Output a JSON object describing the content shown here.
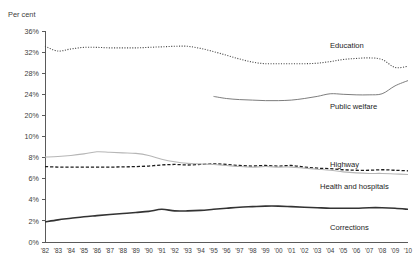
{
  "chart_data": {
    "type": "line",
    "title": "",
    "ylabel": "Per cent",
    "xlabel": "",
    "grid": false,
    "legend_position": "inline-right",
    "broken_axis": true,
    "axis_note": "Y axis is broken: upper band 20%-36%, lower band 0%-10%",
    "y_upper_ticks": [
      "36%",
      "32%",
      "28%",
      "24%",
      "20%"
    ],
    "y_lower_ticks": [
      "10%",
      "8%",
      "6%",
      "4%",
      "2%",
      "0%"
    ],
    "y_upper_values": [
      36,
      32,
      28,
      24,
      20
    ],
    "y_lower_values": [
      10,
      8,
      6,
      4,
      2,
      0
    ],
    "ylim_upper": [
      20,
      36
    ],
    "ylim_lower": [
      0,
      10
    ],
    "categories": [
      "'82",
      "'83",
      "'84",
      "'85",
      "'86",
      "'87",
      "'88",
      "'89",
      "'90",
      "'91",
      "'92",
      "'93",
      "'94",
      "'95",
      "'96",
      "'97",
      "'98",
      "'99",
      "'00",
      "'01",
      "'02",
      "'03",
      "'04",
      "'05",
      "'06",
      "'07",
      "'08",
      "'09",
      "'10"
    ],
    "x": [
      1982,
      1983,
      1984,
      1985,
      1986,
      1987,
      1988,
      1989,
      1990,
      1991,
      1992,
      1993,
      1994,
      1995,
      1996,
      1997,
      1998,
      1999,
      2000,
      2001,
      2002,
      2003,
      2004,
      2005,
      2006,
      2007,
      2008,
      2009,
      2010
    ],
    "series": [
      {
        "name": "Education",
        "label": "Education",
        "band": "upper",
        "style": "dotted",
        "color": "#4a4a4a",
        "width": 1.1,
        "start_index": 0,
        "values": [
          33.1,
          32.2,
          32.6,
          32.9,
          32.9,
          32.8,
          32.8,
          32.8,
          32.9,
          33.0,
          33.1,
          33.1,
          32.7,
          32.1,
          31.4,
          30.7,
          30.1,
          29.8,
          29.8,
          29.8,
          29.8,
          29.9,
          30.2,
          30.6,
          30.8,
          30.9,
          30.6,
          29.1,
          29.3
        ]
      },
      {
        "name": "Public welfare",
        "label": "Public welfare",
        "band": "upper",
        "style": "solid",
        "color": "#6e6e6e",
        "width": 0.9,
        "start_index": 13,
        "values": [
          null,
          null,
          null,
          null,
          null,
          null,
          null,
          null,
          null,
          null,
          null,
          null,
          null,
          23.6,
          23.2,
          23.0,
          22.9,
          22.8,
          22.8,
          22.9,
          23.2,
          23.6,
          24.1,
          24.0,
          23.9,
          23.9,
          24.1,
          25.6,
          26.6
        ]
      },
      {
        "name": "Highway",
        "label": "Highway",
        "band": "lower",
        "style": "dashed",
        "color": "#1c1c1c",
        "width": 1.3,
        "start_index": 0,
        "values": [
          7.15,
          7.1,
          7.1,
          7.1,
          7.1,
          7.1,
          7.12,
          7.15,
          7.2,
          7.3,
          7.35,
          7.3,
          7.35,
          7.4,
          7.35,
          7.25,
          7.2,
          7.25,
          7.2,
          7.25,
          7.1,
          7.0,
          6.95,
          6.85,
          6.8,
          6.8,
          6.85,
          6.8,
          6.75
        ]
      },
      {
        "name": "Health and hospitals",
        "label": "Health and hospitals",
        "band": "lower",
        "style": "solid",
        "color": "#b6b6b6",
        "width": 1.1,
        "start_index": 0,
        "values": [
          8.05,
          8.1,
          8.2,
          8.35,
          8.55,
          8.5,
          8.45,
          8.4,
          8.2,
          7.85,
          7.6,
          7.45,
          7.4,
          7.35,
          7.25,
          7.15,
          7.1,
          7.15,
          7.1,
          7.1,
          7.0,
          6.9,
          6.8,
          6.65,
          6.55,
          6.5,
          6.5,
          6.45,
          6.4
        ]
      },
      {
        "name": "Corrections",
        "label": "Corrections",
        "band": "lower",
        "style": "solid",
        "color": "#333333",
        "width": 1.6,
        "start_index": 0,
        "values": [
          1.9,
          2.1,
          2.25,
          2.4,
          2.5,
          2.6,
          2.7,
          2.8,
          2.9,
          3.1,
          2.95,
          2.95,
          3.0,
          3.1,
          3.2,
          3.3,
          3.35,
          3.4,
          3.4,
          3.35,
          3.3,
          3.25,
          3.2,
          3.2,
          3.2,
          3.25,
          3.25,
          3.2,
          3.1
        ]
      }
    ]
  },
  "labels": {
    "y_axis_title": "Per cent",
    "education": "Education",
    "public_welfare": "Public welfare",
    "highway": "Highway",
    "health_and_hospitals": "Health and hospitals",
    "corrections": "Corrections"
  }
}
